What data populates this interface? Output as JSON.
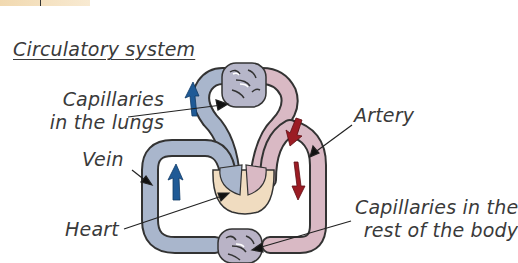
{
  "header_fragment": {
    "text": "· · ·"
  },
  "diagram": {
    "title": "Circulatory system",
    "labels": {
      "capillaries_lungs_line1": "Capillaries",
      "capillaries_lungs_line2": "in the lungs",
      "artery": "Artery",
      "vein": "Vein",
      "heart": "Heart",
      "capillaries_body_line1": "Capillaries in the",
      "capillaries_body_line2": "rest of the body"
    },
    "colors": {
      "deoxygenated_vessel": "#a9b6cc",
      "oxygenated_vessel": "#d9b9c4",
      "vessel_outline": "#333333",
      "blue_arrow": "#1f5a96",
      "red_arrow": "#9b1c24",
      "heart_chamber": "#f0dcc0"
    }
  }
}
